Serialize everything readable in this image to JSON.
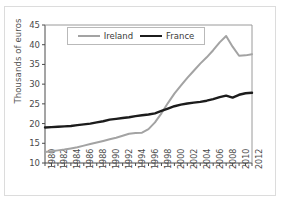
{
  "chart_data": {
    "type": "line",
    "title": "",
    "subtitle": "",
    "xlabel": "",
    "ylabel": "Thousands of euros",
    "xlim": [
      1980,
      2012
    ],
    "ylim": [
      10,
      45
    ],
    "yticks": [
      10,
      15,
      20,
      25,
      30,
      35,
      40,
      45
    ],
    "xticks": [
      1980,
      1982,
      1984,
      1986,
      1988,
      1990,
      1992,
      1994,
      1996,
      1998,
      2000,
      2002,
      2004,
      2006,
      2008,
      2010,
      2012
    ],
    "x": [
      1980,
      1981,
      1982,
      1983,
      1984,
      1985,
      1986,
      1987,
      1988,
      1989,
      1990,
      1991,
      1992,
      1993,
      1994,
      1995,
      1996,
      1997,
      1998,
      1999,
      2000,
      2001,
      2002,
      2003,
      2004,
      2005,
      2006,
      2007,
      2008,
      2009,
      2010,
      2011,
      2012
    ],
    "grid": false,
    "legend_position": "top-center",
    "series": [
      {
        "name": "Ireland",
        "color": "#a3a3a3",
        "values": [
          12.8,
          13.0,
          13.2,
          13.4,
          13.7,
          14.0,
          14.4,
          14.8,
          15.2,
          15.6,
          16.0,
          16.4,
          16.9,
          17.4,
          17.6,
          17.7,
          18.6,
          20.3,
          22.6,
          25.2,
          27.6,
          29.6,
          31.6,
          33.4,
          35.2,
          36.8,
          38.6,
          40.6,
          42.2,
          39.5,
          37.2,
          37.3,
          37.6
        ]
      },
      {
        "name": "France",
        "color": "#1c1c1c",
        "values": [
          19.0,
          19.1,
          19.2,
          19.3,
          19.4,
          19.6,
          19.8,
          20.0,
          20.3,
          20.6,
          21.0,
          21.2,
          21.4,
          21.6,
          21.9,
          22.1,
          22.3,
          22.6,
          23.2,
          23.8,
          24.4,
          24.8,
          25.1,
          25.3,
          25.5,
          25.8,
          26.2,
          26.7,
          27.1,
          26.6,
          27.3,
          27.7,
          27.8
        ]
      }
    ]
  },
  "legend": {
    "items": [
      {
        "label": "Ireland"
      },
      {
        "label": "France"
      }
    ]
  },
  "axes": {
    "y_axis_title": "Thousands of euros"
  }
}
